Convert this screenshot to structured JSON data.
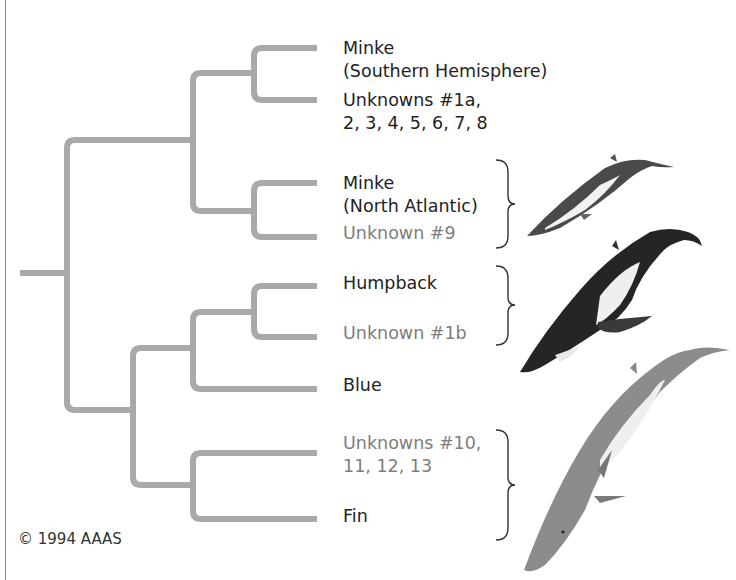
{
  "figure": {
    "type": "phylogenetic-tree",
    "title_cut_off": true,
    "tree_color": "#a9a9a9",
    "label_color": "#222222",
    "unknown_label_color": "#7d7d7d"
  },
  "taxa": [
    {
      "id": "minke-south",
      "line1": "Minke",
      "line2": "(Southern Hemisphere)",
      "unknown": false
    },
    {
      "id": "unknowns-1a",
      "line1": "Unknowns #1a,",
      "line2": "2, 3, 4, 5, 6, 7, 8",
      "unknown": false
    },
    {
      "id": "minke-north",
      "line1": "Minke",
      "line2": "(North Atlantic)",
      "unknown": false
    },
    {
      "id": "unknown-9",
      "line1": "Unknown #9",
      "unknown": true
    },
    {
      "id": "humpback",
      "line1": "Humpback",
      "unknown": false
    },
    {
      "id": "unknown-1b",
      "line1": "Unknown #1b",
      "unknown": true
    },
    {
      "id": "blue",
      "line1": "Blue",
      "unknown": false
    },
    {
      "id": "unknowns-10",
      "line1": "Unknowns #10,",
      "line2": "11, 12, 13",
      "unknown": true
    },
    {
      "id": "fin",
      "line1": "Fin",
      "unknown": false
    }
  ],
  "groups": [
    {
      "name": "Minke whale illustration",
      "brace_for": [
        "Minke (North Atlantic)",
        "Unknown #9"
      ]
    },
    {
      "name": "Humpback whale illustration",
      "brace_for": [
        "Humpback",
        "Unknown #1b"
      ]
    },
    {
      "name": "Fin whale illustration",
      "brace_for": [
        "Unknowns #10, 11, 12, 13",
        "Fin"
      ]
    }
  ],
  "footer": {
    "copyright": "© 1994 AAAS"
  }
}
